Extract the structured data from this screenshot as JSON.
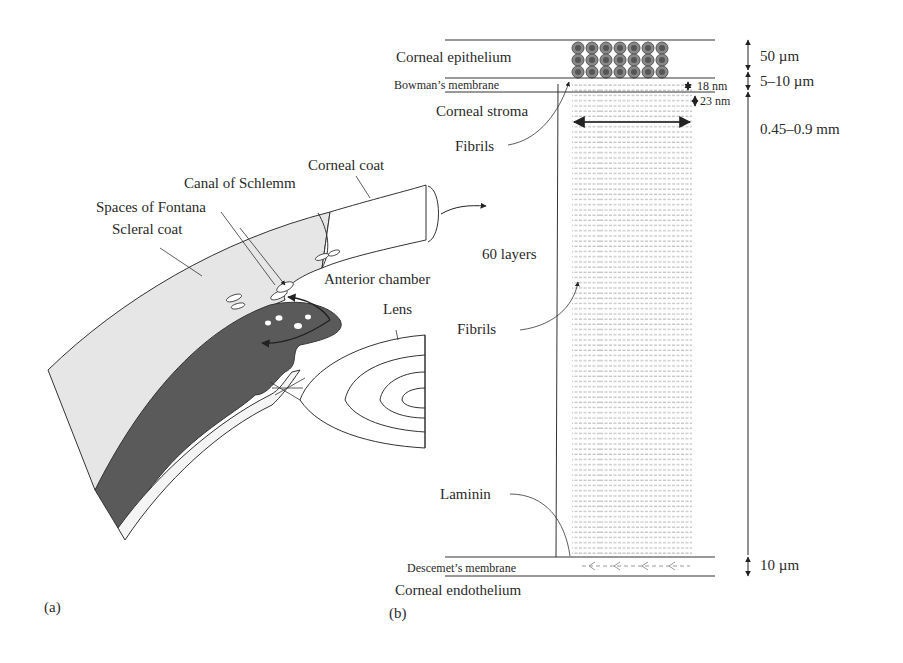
{
  "panel_a": {
    "tag": "(a)",
    "labels": {
      "corneal_coat": "Corneal coat",
      "canal_of_schlemm": "Canal of Schlemm",
      "spaces_of_fontana": "Spaces of Fontana",
      "scleral_coat": "Scleral coat",
      "anterior_chamber": "Anterior chamber",
      "lens": "Lens"
    }
  },
  "panel_b": {
    "tag": "(b)",
    "layers": {
      "corneal_epithelium": "Corneal epithelium",
      "bowmans_membrane": "Bowman’s membrane",
      "corneal_stroma": "Corneal stroma",
      "descemets_membrane": "Descemet’s membrane",
      "corneal_endothelium": "Corneal endothelium"
    },
    "annotations": {
      "fibrils_top": "Fibrils",
      "sixty_layers": "60 layers",
      "fibrils_mid": "Fibrils",
      "laminin": "Laminin",
      "fibril_spacing_1": "18 nm",
      "fibril_spacing_2": "23 nm"
    },
    "dimensions": {
      "epithelium": "50 µm",
      "bowman": "5–10 µm",
      "stroma": "0.45–0.9 mm",
      "descemet": "10 µm"
    }
  }
}
